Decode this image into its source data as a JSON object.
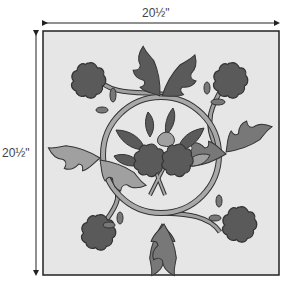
{
  "diagram": {
    "dimensions": {
      "width_label": "20½\"",
      "height_label": "20½\""
    },
    "colors": {
      "background": "#e6e6e6",
      "frame": "#222222",
      "dark_fill": "#5a5a5a",
      "medium_fill": "#787878",
      "light_fill": "#a0a0a0",
      "lighter_fill": "#b4b4b4",
      "outline": "#333333",
      "arrow": "#222222"
    },
    "elements": [
      "center-ring-vine",
      "four-corner-flowers",
      "four-oak-leaf-pairs",
      "center-bouquet"
    ]
  }
}
